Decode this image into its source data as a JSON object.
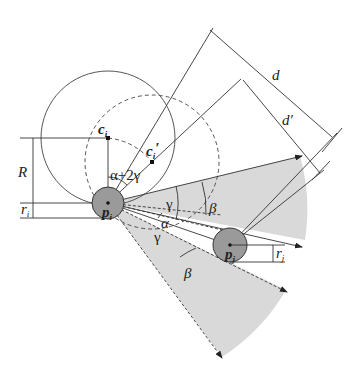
{
  "figure": {
    "type": "geometric diagram",
    "labels": {
      "R": "R",
      "r_i": "r",
      "r_i_sub": "i",
      "r_j": "r",
      "r_j_sub": "j",
      "c_i": "c",
      "c_i_sub": "i",
      "c_i_prime": "c",
      "c_i_prime_sub": "i",
      "c_i_prime_mark": "′",
      "p_i": "p",
      "p_i_sub": "i",
      "p_j": "p",
      "p_j_sub": "j",
      "alpha_plus_2gamma": "α+2γ",
      "alpha": "α",
      "gamma_upper": "γ",
      "gamma_lower": "γ",
      "beta_upper": "β",
      "beta_lower": "β",
      "d": "d",
      "d_prime": "d′"
    },
    "colors": {
      "line": "#333333",
      "sector_fill": "#d9d9d9",
      "disk_fill": "#9a9a9a",
      "background": "#ffffff"
    }
  }
}
